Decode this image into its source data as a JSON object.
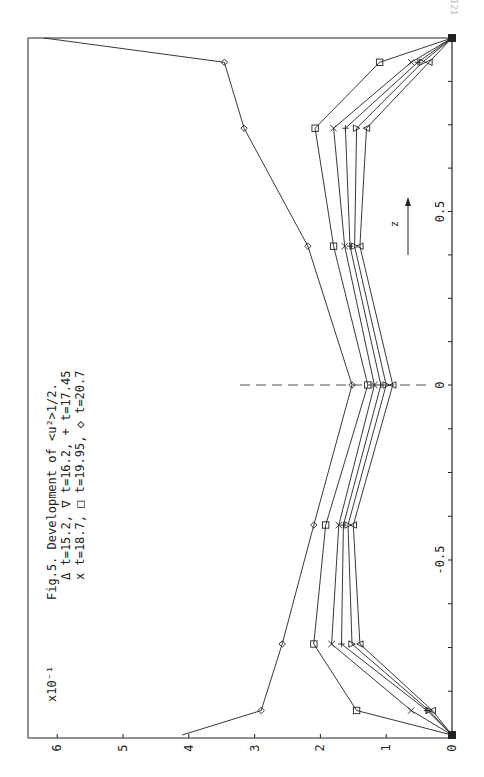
{
  "page": {
    "number": "121"
  },
  "figure": {
    "caption": "Fig.5. Development of <u²>1/2.",
    "legend_lines": [
      "Δ t=15.2, ∇ t=16.2, + t=17.45",
      "x t=18.7, □ t=19.95, ◇ t=20.7"
    ],
    "scale_label": "x10⁻¹",
    "z_arrow_label": "z"
  },
  "chart_data": {
    "type": "line",
    "orientation": "rotated 90° counter-clockwise (z axis runs vertically, value axis horizontally)",
    "xlabel": "z",
    "ylabel": "<u²>^1/2 (x10^-1)",
    "xlim": [
      -1.0,
      1.0
    ],
    "ylim": [
      0,
      6.5
    ],
    "x_ticks": [
      "-0.5",
      "0",
      "0.5"
    ],
    "y_ticks": [
      "0",
      "1",
      "2",
      "3",
      "4",
      "5",
      "6"
    ],
    "y_multiplier": "x10^-1",
    "grid": false,
    "legend_position": "top-left text block",
    "x": [
      -1.0,
      -0.93,
      -0.74,
      -0.4,
      0.0,
      0.4,
      0.74,
      0.93,
      1.0
    ],
    "series": [
      {
        "name": "t=15.2",
        "marker": "triangle-up",
        "values": [
          0,
          0.3,
          1.4,
          1.5,
          0.9,
          1.4,
          1.3,
          0.35,
          0
        ]
      },
      {
        "name": "t=16.2",
        "marker": "triangle-down",
        "values": [
          0,
          0.35,
          1.52,
          1.58,
          1.0,
          1.48,
          1.45,
          0.45,
          0
        ]
      },
      {
        "name": "t=17.45",
        "marker": "plus",
        "values": [
          0,
          0.38,
          1.68,
          1.65,
          1.08,
          1.55,
          1.62,
          0.52,
          0
        ]
      },
      {
        "name": "t=18.7",
        "marker": "x",
        "values": [
          0,
          0.62,
          1.83,
          1.72,
          1.18,
          1.63,
          1.8,
          0.62,
          0
        ]
      },
      {
        "name": "t=19.95",
        "marker": "square",
        "values": [
          0,
          1.45,
          2.1,
          1.92,
          1.28,
          1.8,
          2.08,
          1.1,
          0
        ]
      },
      {
        "name": "t=20.7",
        "marker": "diamond",
        "values": [
          4.1,
          2.9,
          2.58,
          2.1,
          1.52,
          2.19,
          3.16,
          3.46,
          6.2
        ]
      }
    ]
  },
  "colors": {
    "ink": "#222222",
    "background": "#ffffff"
  }
}
